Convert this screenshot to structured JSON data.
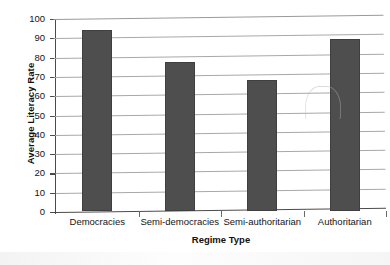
{
  "chart_data": {
    "type": "bar",
    "title": "",
    "xlabel": "Regime Type",
    "ylabel": "Average Literacy Rate",
    "categories": [
      "Democracies",
      "Semi-democracies",
      "Semi-authoritarian",
      "Authoritarian"
    ],
    "values": [
      94,
      77,
      68,
      89
    ],
    "ylim": [
      0,
      100
    ],
    "yticks": [
      0,
      10,
      20,
      30,
      40,
      50,
      60,
      70,
      80,
      90,
      100
    ],
    "ytick_labels": [
      "0",
      "10",
      "20",
      "30",
      "40",
      "50",
      "60",
      "70",
      "80",
      "90",
      "100"
    ],
    "grid": true,
    "legend": false,
    "legend_position": "none",
    "bar_color": "#4e4e4e",
    "gridline_color": "#a8a8a8",
    "axis_color": "#4b4b4b",
    "background_color": "#ffffff"
  }
}
